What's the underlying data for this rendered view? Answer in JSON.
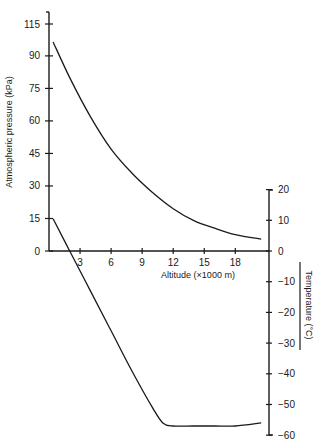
{
  "chart_data": {
    "type": "line",
    "title": "",
    "xlabel": "Altitude (×1000 m)",
    "x_ticks": [
      3,
      6,
      9,
      12,
      15,
      18
    ],
    "y_left": {
      "label": "Atmospheric pressure (kPa)",
      "ticks": [
        0,
        15,
        30,
        45,
        60,
        75,
        90,
        115
      ]
    },
    "y_right": {
      "label": "Temperature (°C)",
      "ticks": [
        20,
        10,
        0,
        -10,
        -20,
        -30,
        -40,
        -50,
        -60
      ]
    },
    "grid": false,
    "legend": null,
    "series": [
      {
        "name": "Atmospheric pressure",
        "axis": "left",
        "unit": "kPa",
        "x": [
          0.4,
          2,
          4,
          6,
          8,
          10,
          12,
          14,
          16,
          18,
          20.5
        ],
        "y": [
          101,
          80,
          62,
          47,
          36,
          27,
          19.5,
          14,
          10.5,
          7.5,
          5.5
        ]
      },
      {
        "name": "Temperature",
        "axis": "right",
        "unit": "°C",
        "x": [
          0.4,
          2,
          4,
          6,
          8,
          10,
          11,
          12,
          14,
          16,
          18,
          20.5
        ],
        "y": [
          10.5,
          0,
          -13,
          -26,
          -39,
          -51,
          -56,
          -57,
          -57,
          -57,
          -57,
          -56
        ]
      }
    ]
  }
}
